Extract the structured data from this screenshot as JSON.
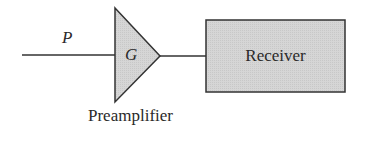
{
  "diagram": {
    "input_signal": {
      "label": "P"
    },
    "preamplifier": {
      "symbol": "G",
      "caption": "Preamplifier"
    },
    "receiver": {
      "label": "Receiver"
    },
    "colors": {
      "fill": "#d4d4d4",
      "stroke": "#333333"
    }
  }
}
